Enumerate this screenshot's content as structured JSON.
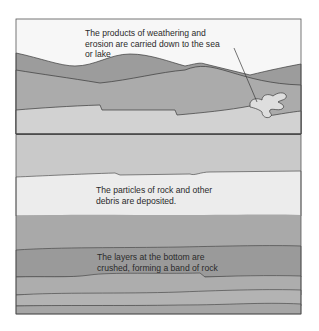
{
  "diagram": {
    "top_panel": {
      "caption": {
        "line1": "The products of weathering and",
        "line2": "erosion are carried down to the sea",
        "line3": "or lake"
      }
    },
    "bottom_panel": {
      "caption_deposit": {
        "line1": "The particles of rock and other",
        "line2": "debris are deposited."
      },
      "caption_crush": {
        "line1": "The layers at the bottom are",
        "line2": "crushed, forming a band of rock"
      }
    },
    "colors": {
      "sky": "#f7f7f7",
      "far_hill": "#9c9c9c",
      "near_hill": "#ababab",
      "foreground": "#d2d2d2",
      "water": "#dedede",
      "sediment_top": "#c9c9c9",
      "deposit_band": "#ececec",
      "layer_mid": "#a9a9a9",
      "layer_dark": "#9a9a9a",
      "layer_low": "#b3b3b3",
      "outline": "#3a3a3a"
    }
  }
}
